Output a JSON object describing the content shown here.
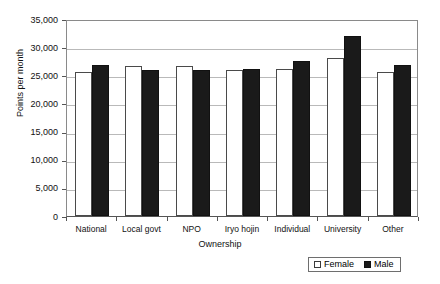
{
  "chart_data": {
    "type": "bar",
    "title": "",
    "xlabel": "Ownership",
    "ylabel": "Points per month",
    "categories": [
      "National",
      "Local govt",
      "NPO",
      "Iryo hojin",
      "Individual",
      "University",
      "Other"
    ],
    "series": [
      {
        "name": "Female",
        "values": [
          25600,
          26700,
          26700,
          25900,
          26200,
          28000,
          25600
        ]
      },
      {
        "name": "Male",
        "values": [
          26800,
          26000,
          26000,
          26200,
          27500,
          32000,
          26900
        ]
      }
    ],
    "ylim": [
      0,
      35000
    ],
    "yticks": [
      0,
      5000,
      10000,
      15000,
      20000,
      25000,
      30000,
      35000
    ],
    "ytick_labels": [
      "0",
      "5,000",
      "10,000",
      "15,000",
      "20,000",
      "25,000",
      "30,000",
      "35,000"
    ],
    "grid": true,
    "legend_position": "bottom-right",
    "legend_entries": [
      "Female",
      "Male"
    ],
    "colors": {
      "female": "#ffffff",
      "male": "#1a1a1a",
      "grid": "#b9b9b9",
      "axis": "#555555"
    }
  }
}
